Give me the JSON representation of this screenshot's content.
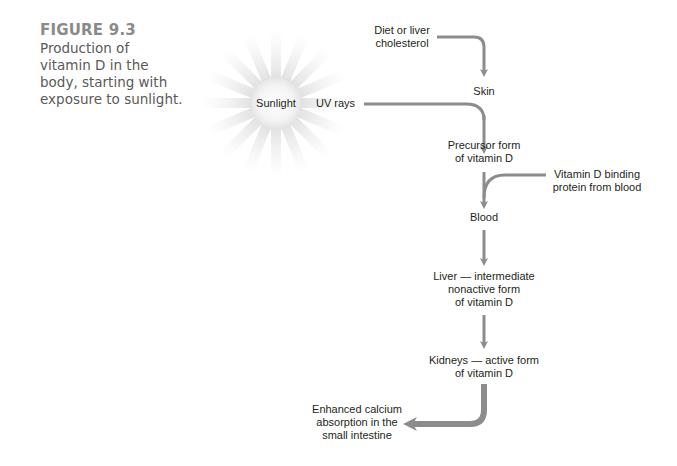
{
  "figure": {
    "number": "FIGURE 9.3",
    "caption_lines": [
      "Production of",
      "vitamin D in the",
      "body, starting with",
      "exposure to sunlight."
    ]
  },
  "sun": {
    "label": "Sunlight",
    "icon": "sun-icon"
  },
  "nodes": {
    "diet": {
      "lines": [
        "Diet or liver",
        "cholesterol"
      ]
    },
    "uv": {
      "label": "UV rays"
    },
    "skin": {
      "label": "Skin"
    },
    "precursor": {
      "lines": [
        "Precursor form",
        "of vitamin D"
      ]
    },
    "binding": {
      "lines": [
        "Vitamin D binding",
        "protein from blood"
      ]
    },
    "blood": {
      "label": "Blood"
    },
    "liver": {
      "lines": [
        "Liver — intermediate",
        "nonactive form",
        "of vitamin D"
      ]
    },
    "kidneys": {
      "lines": [
        "Kidneys — active form",
        "of vitamin D"
      ]
    },
    "outcome": {
      "lines": [
        "Enhanced calcium",
        "absorption in the",
        "small intestine"
      ]
    }
  },
  "colors": {
    "arrow": "#8c8c8c",
    "caption_title": "#8a8a8a",
    "caption_text": "#5a5a5a",
    "text": "#231f20"
  }
}
